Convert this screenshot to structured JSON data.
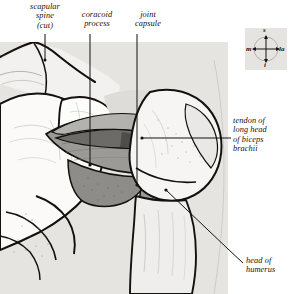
{
  "figure": {
    "kind": "anatomical-illustration",
    "panel": {
      "background_color": "#e6e4e1",
      "x": 0,
      "y": 42,
      "width": 228,
      "height": 252
    },
    "page_background": "#ffffff",
    "ink_color": "#14100d"
  },
  "labels": [
    {
      "id": "scapular-spine",
      "text": "scapular\nspine\n(cut)",
      "x": 14,
      "y": 2,
      "width": 62,
      "align": "center",
      "leader": {
        "type": "vertical",
        "x": 45,
        "y1": 34,
        "y2": 60,
        "dot": true
      }
    },
    {
      "id": "coracoid-process",
      "text": "coracoid\nprocess",
      "x": 68,
      "y": 10,
      "width": 58,
      "align": "center",
      "leader": {
        "type": "vertical",
        "x": 90,
        "y1": 34,
        "y2": 165,
        "dot": true
      }
    },
    {
      "id": "joint-capsule",
      "text": "joint\ncapsule",
      "x": 124,
      "y": 10,
      "width": 48,
      "align": "center",
      "leader": {
        "type": "vertical",
        "x": 137,
        "y1": 34,
        "y2": 185,
        "dot": true
      }
    },
    {
      "id": "tendon-long-head-biceps",
      "text": "tendon of\nlong head\nof biceps\nbrachii",
      "x": 233,
      "y": 116,
      "width": 58,
      "align": "left",
      "leader": {
        "type": "horizontal",
        "x1": 142,
        "x2": 231,
        "y": 138,
        "dot": true
      }
    },
    {
      "id": "head-of-humerus",
      "text": "head of\nhumerus",
      "x": 246,
      "y": 256,
      "width": 46,
      "align": "left",
      "leader": {
        "type": "diagonal",
        "x1": 166,
        "y1": 190,
        "x2": 243,
        "y2": 263,
        "dot": true
      }
    }
  ],
  "compass": {
    "id": "orientation-key",
    "x": 245,
    "y": 28,
    "size": 42,
    "background_color": "#e6e4e1",
    "superior": "s",
    "medial": "m",
    "lateral": "la",
    "inferior": "i"
  },
  "structures": [
    {
      "id": "scapula-body",
      "label": "scapula",
      "fill": "#fbfaf9"
    },
    {
      "id": "scapular-spine-cut",
      "label": "scapular spine (cut)",
      "fill": "#f7f6f4"
    },
    {
      "id": "coracoid-process",
      "label": "coracoid process",
      "fill": "#fdfdfc"
    },
    {
      "id": "joint-capsule",
      "label": "joint capsule",
      "fill": "#9c9a97"
    },
    {
      "id": "capsule-upper",
      "label": "superior capsule fold",
      "fill": "#b4b2af"
    },
    {
      "id": "biceps-tendon",
      "label": "tendon of long head of biceps brachii",
      "fill": "#6d6b68"
    },
    {
      "id": "humeral-head",
      "label": "head of humerus",
      "fill": "#f6f5f3"
    },
    {
      "id": "humeral-shaft",
      "label": "shaft of humerus",
      "fill": "#efeeec"
    },
    {
      "id": "glenoid-region",
      "label": "glenoid cavity region",
      "fill": "#dedcd9"
    }
  ]
}
